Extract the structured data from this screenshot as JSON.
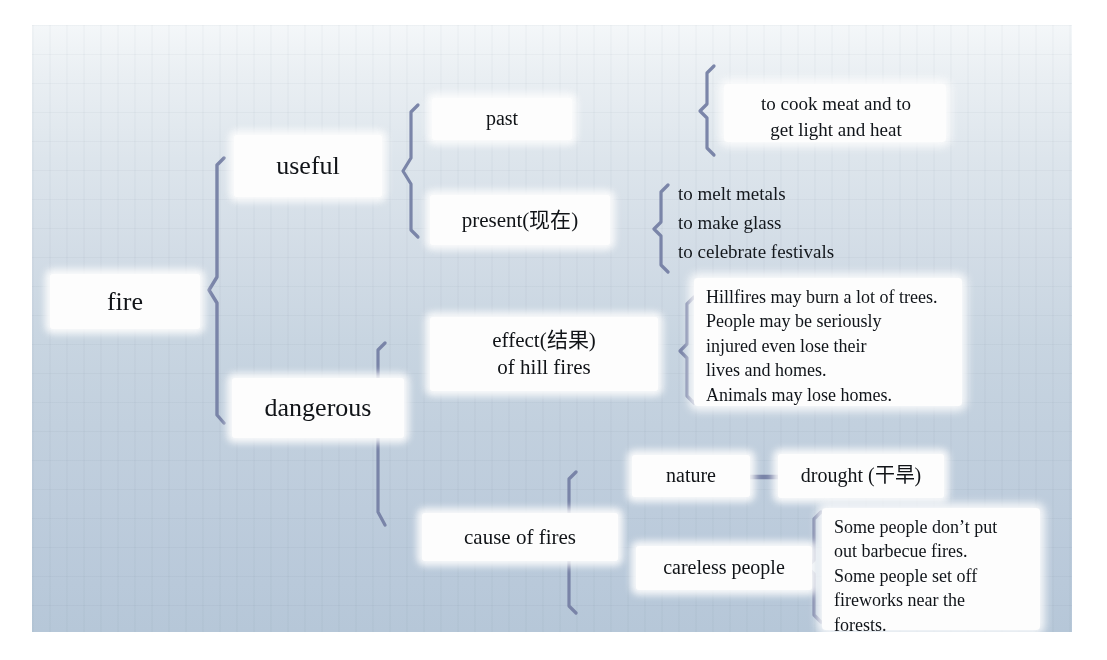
{
  "diagram": {
    "type": "mind-map",
    "root": {
      "label": "fire"
    },
    "branches": [
      {
        "label": "useful",
        "children": [
          {
            "label": "past",
            "details": [
              "to cook meat and to",
              "get light and heat"
            ]
          },
          {
            "label": "present(现在)",
            "details": [
              "to melt metals",
              "to make glass",
              "to celebrate festivals"
            ]
          }
        ]
      },
      {
        "label": "dangerous",
        "children": [
          {
            "label_line1": "effect(结果)",
            "label_line2": "of hill fires",
            "details": [
              "Hillfires may burn a lot of trees.",
              "People may be seriously",
              "injured even lose their",
              "lives and homes.",
              "Animals may lose homes."
            ]
          },
          {
            "label": "cause of fires",
            "children": [
              {
                "label": "nature",
                "link": "drought (干旱)"
              },
              {
                "label": "careless people",
                "details": [
                  "Some people don’t put",
                  "out barbecue fires.",
                  "Some people set off",
                  "fireworks near the",
                  "forests."
                ]
              }
            ]
          }
        ]
      }
    ]
  },
  "nodes": {
    "fire": "fire",
    "useful": "useful",
    "past": "past",
    "present": "present(现在)",
    "dangerous": "dangerous",
    "effect_line1": "effect(结果)",
    "effect_line2": "of hill fires",
    "cause": "cause of fires",
    "nature": "nature",
    "drought": "drought (干旱)",
    "careless": "careless people"
  },
  "details": {
    "past_1": "to cook meat and to",
    "past_2": "get light and heat",
    "present_1": "to melt metals",
    "present_2": "to make glass",
    "present_3": "to celebrate festivals",
    "effect_1": "Hillfires may burn a lot of trees.",
    "effect_2": "People may be seriously",
    "effect_3": "injured even lose their",
    "effect_4": "lives and homes.",
    "effect_5": "Animals may lose homes.",
    "careless_1": "Some people don’t put",
    "careless_2": "out barbecue fires.",
    "careless_3": "Some people set off",
    "careless_4": "fireworks near the",
    "careless_5": "forests."
  },
  "colors": {
    "brace": "#7580a4",
    "node_bg": "#fdfdfd",
    "text": "#111418",
    "panel_top": "#f4f7f9",
    "panel_bottom": "#b6c7d8"
  }
}
